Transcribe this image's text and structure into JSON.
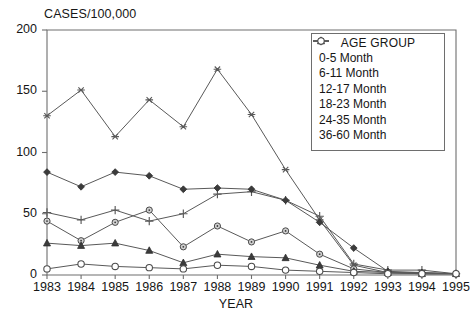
{
  "chart_data": {
    "type": "line",
    "title": "",
    "ylabel": "CASES/100,000",
    "xlabel": "YEAR",
    "categories": [
      "1983",
      "1984",
      "1985",
      "1986",
      "1987",
      "1988",
      "1989",
      "1990",
      "1991",
      "1992",
      "1993",
      "1994",
      "1995"
    ],
    "x": [
      1983,
      1984,
      1985,
      1986,
      1987,
      1988,
      1989,
      1990,
      1991,
      1992,
      1993,
      1994,
      1995
    ],
    "ylim": [
      0,
      200
    ],
    "yticks": [
      0,
      50,
      100,
      150,
      200
    ],
    "grid": false,
    "legend_position": "upper-right",
    "legend_title": "AGE GROUP",
    "series": [
      {
        "name": "0-5 Month",
        "marker": "plus",
        "values": [
          51,
          45,
          53,
          44,
          50,
          66,
          68,
          61,
          48,
          9,
          4,
          4,
          1
        ]
      },
      {
        "name": "6-11 Month",
        "marker": "asterisk",
        "values": [
          130,
          151,
          113,
          143,
          121,
          168,
          131,
          86,
          45,
          8,
          2,
          2,
          1
        ]
      },
      {
        "name": "12-17 Month",
        "marker": "filled-diamond",
        "values": [
          84,
          72,
          84,
          81,
          70,
          71,
          70,
          61,
          43,
          22,
          3,
          2,
          1
        ]
      },
      {
        "name": "18-23 Month",
        "marker": "circle-dot",
        "values": [
          44,
          28,
          43,
          53,
          23,
          40,
          27,
          36,
          17,
          5,
          2,
          1,
          1
        ]
      },
      {
        "name": "24-35 Month",
        "marker": "filled-triangle",
        "values": [
          26,
          24,
          26,
          20,
          10,
          17,
          15,
          14,
          8,
          3,
          2,
          1,
          1
        ]
      },
      {
        "name": "36-60 Month",
        "marker": "open-circle",
        "values": [
          5,
          9,
          7,
          6,
          5,
          8,
          7,
          4,
          3,
          2,
          1,
          1,
          1
        ]
      }
    ]
  },
  "axes": {
    "y_title": "CASES/100,000",
    "x_title": "YEAR",
    "y_ticks": [
      "200",
      "150",
      "100",
      "50",
      "0"
    ],
    "x_ticks": [
      "1983",
      "1984",
      "1985",
      "1986",
      "1987",
      "1988",
      "1989",
      "1990",
      "1991",
      "1992",
      "1993",
      "1994",
      "1995"
    ]
  },
  "legend": {
    "title": "AGE GROUP",
    "items": [
      {
        "label": "0-5 Month",
        "icon": "plus-marker-icon"
      },
      {
        "label": "6-11 Month",
        "icon": "asterisk-marker-icon"
      },
      {
        "label": "12-17 Month",
        "icon": "filled-diamond-marker-icon"
      },
      {
        "label": "18-23 Month",
        "icon": "circle-dot-marker-icon"
      },
      {
        "label": "24-35 Month",
        "icon": "filled-triangle-marker-icon"
      },
      {
        "label": "36-60 Month",
        "icon": "open-circle-marker-icon"
      }
    ]
  },
  "style": {
    "line_color": "#595959",
    "frame_color": "#6e6e6e",
    "text_color": "#161616"
  }
}
